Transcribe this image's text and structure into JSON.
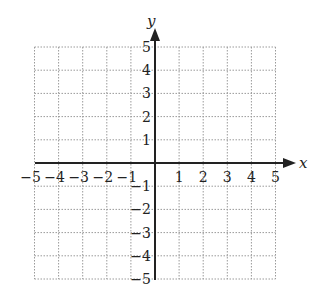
{
  "chart_data": {
    "type": "scatter",
    "title": "",
    "xlabel": "x",
    "ylabel": "y",
    "xlim": [
      -5,
      5
    ],
    "ylim": [
      -5,
      5
    ],
    "grid": true,
    "grid_style": "dotted",
    "x_ticks": [
      "-5",
      "-4",
      "-3",
      "-2",
      "-1",
      "1",
      "2",
      "3",
      "4",
      "5"
    ],
    "y_ticks": [
      "5",
      "4",
      "3",
      "2",
      "1",
      "-1",
      "-2",
      "-3",
      "-4",
      "-5"
    ],
    "series": [],
    "legend": null
  },
  "colors": {
    "axis": "#222222",
    "grid": "#9a9a9a",
    "background": "#ffffff"
  }
}
